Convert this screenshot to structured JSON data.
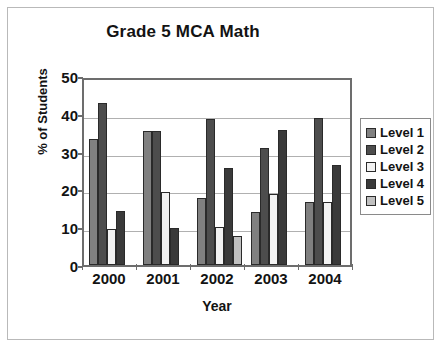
{
  "frame": {
    "background": "#ffffff",
    "border_color": "#b9b9b9"
  },
  "chart_data": {
    "type": "bar",
    "title": "Grade 5 MCA Math",
    "xlabel": "Year",
    "ylabel": "% of Students",
    "categories": [
      "2000",
      "2001",
      "2002",
      "2003",
      "2004"
    ],
    "ylim": [
      0,
      50
    ],
    "yticks": [
      0,
      10,
      20,
      30,
      40,
      50
    ],
    "ytick_labels": [
      "0",
      "10",
      "20",
      "30",
      "40",
      "50"
    ],
    "grid": true,
    "legend_position": "right",
    "series": [
      {
        "name": "Level 1",
        "color": "#808080",
        "values": [
          33.4,
          35.4,
          17.7,
          14.0,
          16.8
        ]
      },
      {
        "name": "Level 2",
        "color": "#4d4d4d",
        "values": [
          42.9,
          35.4,
          38.5,
          30.9,
          38.8
        ]
      },
      {
        "name": "Level 3",
        "color": "#f2f2f2",
        "values": [
          9.5,
          19.3,
          10.1,
          18.8,
          16.8
        ]
      },
      {
        "name": "Level 4",
        "color": "#3a3a3a",
        "values": [
          14.2,
          9.8,
          25.6,
          35.6,
          26.5
        ]
      },
      {
        "name": "Level 5",
        "color": "#c0c0c0",
        "values": [
          0,
          0,
          7.6,
          0,
          0
        ]
      }
    ]
  }
}
